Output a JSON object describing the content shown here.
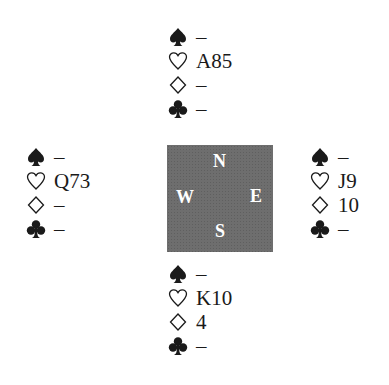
{
  "deal": {
    "north": {
      "spades": "–",
      "hearts": "A85",
      "diamonds": "–",
      "clubs": "–"
    },
    "west": {
      "spades": "–",
      "hearts": "Q73",
      "diamonds": "–",
      "clubs": "–"
    },
    "east": {
      "spades": "–",
      "hearts": "J9",
      "diamonds": "10",
      "clubs": "–"
    },
    "south": {
      "spades": "–",
      "hearts": "K10",
      "diamonds": "4",
      "clubs": "–"
    }
  },
  "compass": {
    "north": "N",
    "south": "S",
    "east": "E",
    "west": "W",
    "color": "#6e6e6e"
  },
  "suit_icons": [
    "spade-icon",
    "heart-icon",
    "diamond-icon",
    "club-icon"
  ]
}
